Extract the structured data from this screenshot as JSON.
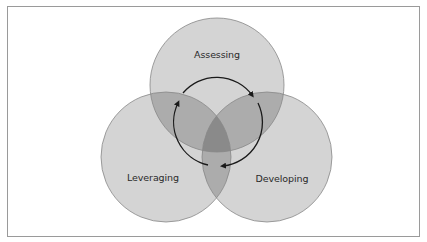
{
  "diagram": {
    "type": "venn-cycle",
    "sets": [
      {
        "id": "assessing",
        "label": "Assessing"
      },
      {
        "id": "leveraging",
        "label": "Leveraging"
      },
      {
        "id": "developing",
        "label": "Developing"
      }
    ],
    "cycle": {
      "direction": "clockwise",
      "order": [
        "Assessing",
        "Developing",
        "Leveraging"
      ]
    },
    "colors": {
      "single_fill": "#d4d4d4",
      "double_overlap": "#acacac",
      "triple_overlap": "#8a8a8a",
      "outline": "#888888",
      "arrow": "#1a1a1a",
      "frame": "#9a9a9a"
    }
  }
}
